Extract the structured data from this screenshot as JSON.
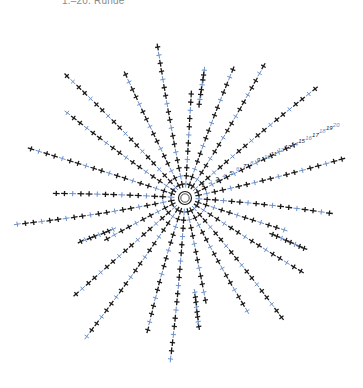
{
  "header": {
    "title": "1.–20. Runde"
  },
  "diagram": {
    "type": "crochet-chart",
    "center_symbol": "magic-ring",
    "spoke_count": 24,
    "rounds": 20,
    "round_labels": [
      "1",
      "2",
      "3",
      "4",
      "5",
      "6",
      "7",
      "8",
      "9",
      "10",
      "11",
      "12",
      "13",
      "14",
      "15",
      "16",
      "17",
      "18",
      "19",
      "20"
    ],
    "colors": {
      "dark_stitch": "#1a1a1a",
      "light_stitch": "#6b8fc9",
      "label": "#6b8fc9"
    },
    "legend_symbols": [
      "single-crochet-cross",
      "magic-ring"
    ],
    "spoke_lengths": [
      20,
      16,
      18,
      20,
      14,
      19,
      17,
      20,
      16,
      18,
      15,
      20,
      19,
      16,
      20,
      17,
      18,
      20,
      15,
      19,
      17,
      20,
      16,
      18
    ],
    "folded_spokes": [
      0,
      7,
      11,
      16
    ]
  }
}
